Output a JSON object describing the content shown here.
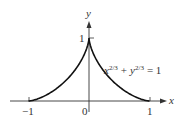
{
  "chart_data": {
    "type": "line",
    "title": "",
    "curve": "astroid upper half",
    "equation": {
      "base_x": "x",
      "exp_x": "2/3",
      "plus": "+",
      "base_y": "y",
      "exp_y": "2/3",
      "rhs": "= 1"
    },
    "xlabel": "x",
    "ylabel": "y",
    "x_ticks": [
      "−1",
      "0",
      "1"
    ],
    "y_ticks": [
      "1"
    ],
    "xlim": [
      -1,
      1
    ],
    "ylim": [
      0,
      1
    ],
    "points": [
      [
        -1,
        0
      ],
      [
        -0.729,
        0.001
      ],
      [
        -0.512,
        0.008
      ],
      [
        -0.343,
        0.027
      ],
      [
        -0.216,
        0.064
      ],
      [
        -0.125,
        0.125
      ],
      [
        -0.064,
        0.216
      ],
      [
        -0.027,
        0.343
      ],
      [
        -0.008,
        0.512
      ],
      [
        -0.001,
        0.729
      ],
      [
        0,
        1
      ],
      [
        0.001,
        0.729
      ],
      [
        0.008,
        0.512
      ],
      [
        0.027,
        0.343
      ],
      [
        0.064,
        0.216
      ],
      [
        0.125,
        0.125
      ],
      [
        0.216,
        0.064
      ],
      [
        0.343,
        0.027
      ],
      [
        0.512,
        0.008
      ],
      [
        0.729,
        0.001
      ],
      [
        1,
        0
      ]
    ],
    "grid": false
  }
}
